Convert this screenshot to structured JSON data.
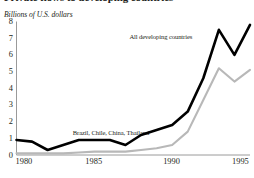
{
  "figure": {
    "cut_title": "Private flows to developing countries",
    "axis_title": "Billions of U.S. dollars"
  },
  "chart_data": {
    "type": "line",
    "title": "Private flows to developing countries",
    "subtitle": "",
    "xlabel": "",
    "ylabel": "Billions of U.S. dollars",
    "xlim": [
      1980,
      1995
    ],
    "ylim": [
      0,
      8
    ],
    "grid": false,
    "legend_position": "inline-annotation",
    "xticks": [
      "1980",
      "1985",
      "1990",
      "1995"
    ],
    "xtick_values": [
      1980,
      1985,
      1990,
      1995
    ],
    "yticks": [
      "0",
      "1",
      "2",
      "3",
      "4",
      "5",
      "6",
      "7",
      "8"
    ],
    "ytick_values": [
      0,
      1,
      2,
      3,
      4,
      5,
      6,
      7,
      8
    ],
    "x": [
      1980,
      1981,
      1982,
      1983,
      1984,
      1985,
      1986,
      1987,
      1988,
      1989,
      1990,
      1991,
      1992,
      1993,
      1994,
      1995
    ],
    "series": [
      {
        "name": "All developing countries",
        "color": "#000000",
        "values": [
          0.9,
          0.8,
          0.3,
          0.6,
          0.9,
          0.9,
          0.9,
          0.6,
          1.2,
          1.5,
          1.8,
          2.6,
          4.6,
          7.5,
          6.0,
          7.8
        ]
      },
      {
        "name": "Brazil, Chile, China, Thailand",
        "color": "#b8b8b8",
        "values": [
          0.1,
          0.1,
          0.1,
          0.1,
          0.15,
          0.2,
          0.2,
          0.2,
          0.3,
          0.4,
          0.6,
          1.4,
          3.3,
          5.2,
          4.4,
          5.1
        ]
      }
    ],
    "annotations": [
      {
        "text": "All developing countries",
        "x": 1991.3,
        "y": 7.1
      },
      {
        "text": "Brazil, Chile, China, Thailand",
        "x": 1988.5,
        "y": 1.3
      }
    ]
  }
}
